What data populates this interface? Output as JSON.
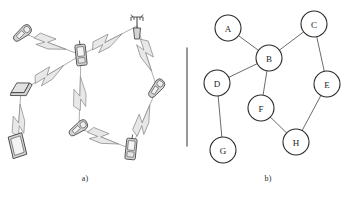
{
  "figure": {
    "panels": [
      {
        "id": "a",
        "caption": "a)",
        "type": "wireless-mesh-illustration",
        "description": "Ad-hoc wireless network of mobile devices connected by lightning-bolt radio links",
        "devices": [
          {
            "name": "mobile-phone",
            "icon": "flip-phone-icon",
            "x": 23,
            "y": 33,
            "rot": -38
          },
          {
            "name": "handheld-pda",
            "icon": "pda-icon",
            "x": 81,
            "y": 55,
            "rot": -6
          },
          {
            "name": "antenna-tower",
            "icon": "antenna-tower-icon",
            "x": 137,
            "y": 26,
            "rot": 0
          },
          {
            "name": "laptop",
            "icon": "laptop-icon",
            "x": 21,
            "y": 91,
            "rot": -18
          },
          {
            "name": "tablet",
            "icon": "tablet-icon",
            "x": 17,
            "y": 146,
            "rot": -8
          },
          {
            "name": "mobile-phone",
            "icon": "flip-phone-icon",
            "x": 79,
            "y": 128,
            "rot": -34
          },
          {
            "name": "mobile-phone",
            "icon": "flip-phone-icon",
            "x": 157,
            "y": 88,
            "rot": -50
          },
          {
            "name": "handheld-pda",
            "icon": "pda-icon",
            "x": 131,
            "y": 149,
            "rot": 6
          }
        ],
        "links": [
          {
            "from": 0,
            "to": 1
          },
          {
            "from": 1,
            "to": 2
          },
          {
            "from": 1,
            "to": 3
          },
          {
            "from": 1,
            "to": 5
          },
          {
            "from": 2,
            "to": 6
          },
          {
            "from": 3,
            "to": 4
          },
          {
            "from": 5,
            "to": 7
          },
          {
            "from": 6,
            "to": 7
          }
        ]
      },
      {
        "id": "b",
        "caption": "b)",
        "type": "graph-abstraction",
        "description": "Abstract undirected graph representation of the same network"
      }
    ],
    "divider": {
      "name": "panel-divider",
      "x": 187,
      "y1": 48,
      "y2": 146
    }
  },
  "chart_data": {
    "type": "diagram-graph",
    "title": "",
    "node_radius": 13,
    "nodes": [
      {
        "id": "A",
        "label": "A",
        "x": 228,
        "y": 28
      },
      {
        "id": "B",
        "label": "B",
        "x": 269,
        "y": 58
      },
      {
        "id": "C",
        "label": "C",
        "x": 314,
        "y": 24
      },
      {
        "id": "D",
        "label": "D",
        "x": 217,
        "y": 83
      },
      {
        "id": "E",
        "label": "E",
        "x": 327,
        "y": 84
      },
      {
        "id": "F",
        "label": "F",
        "x": 261,
        "y": 108
      },
      {
        "id": "G",
        "label": "G",
        "x": 223,
        "y": 150
      },
      {
        "id": "H",
        "label": "H",
        "x": 296,
        "y": 142
      }
    ],
    "edges": [
      {
        "from": "A",
        "to": "B"
      },
      {
        "from": "B",
        "to": "C"
      },
      {
        "from": "B",
        "to": "D"
      },
      {
        "from": "B",
        "to": "F"
      },
      {
        "from": "C",
        "to": "E"
      },
      {
        "from": "D",
        "to": "G"
      },
      {
        "from": "F",
        "to": "H"
      },
      {
        "from": "E",
        "to": "H"
      }
    ],
    "directed": false,
    "legend": [],
    "grid": false
  },
  "colors": {
    "ink": "#1d1d1d",
    "node_stroke": "#2a2a2a",
    "edge_stroke": "#5a5a5a",
    "divider": "#6b6b6b",
    "bolt_fill": "#e8e8e8",
    "bolt_stroke": "#8a8a8a",
    "device_fill": "#d4d4d4",
    "device_stroke": "#3a3a3a",
    "background": "#ffffff"
  }
}
